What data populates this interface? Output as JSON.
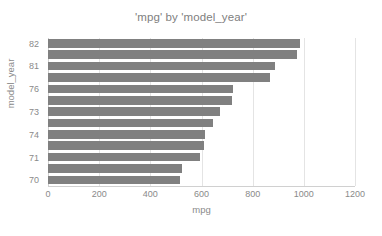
{
  "chart_data": {
    "type": "bar",
    "orientation": "horizontal",
    "title": "'mpg' by 'model_year'",
    "xlabel": "mpg",
    "ylabel": "model_year",
    "xlim": [
      0,
      1200
    ],
    "xticks": [
      0,
      200,
      400,
      600,
      800,
      1000,
      1200
    ],
    "xtick_labels": [
      "0",
      "200",
      "400",
      "600",
      "800",
      "1000",
      "1200"
    ],
    "grid": true,
    "grid_axis": "x",
    "legend": false,
    "bar_color": "#808080",
    "categories": [
      "82",
      "",
      "81",
      "",
      "76",
      "",
      "73",
      "",
      "74",
      "",
      "71",
      "",
      "70"
    ],
    "ytick_labels": [
      "82",
      "81",
      "76",
      "73",
      "74",
      "71",
      "70"
    ],
    "values": [
      984,
      975,
      886,
      867,
      723,
      719,
      672,
      645,
      614,
      610,
      594,
      523,
      515
    ]
  }
}
